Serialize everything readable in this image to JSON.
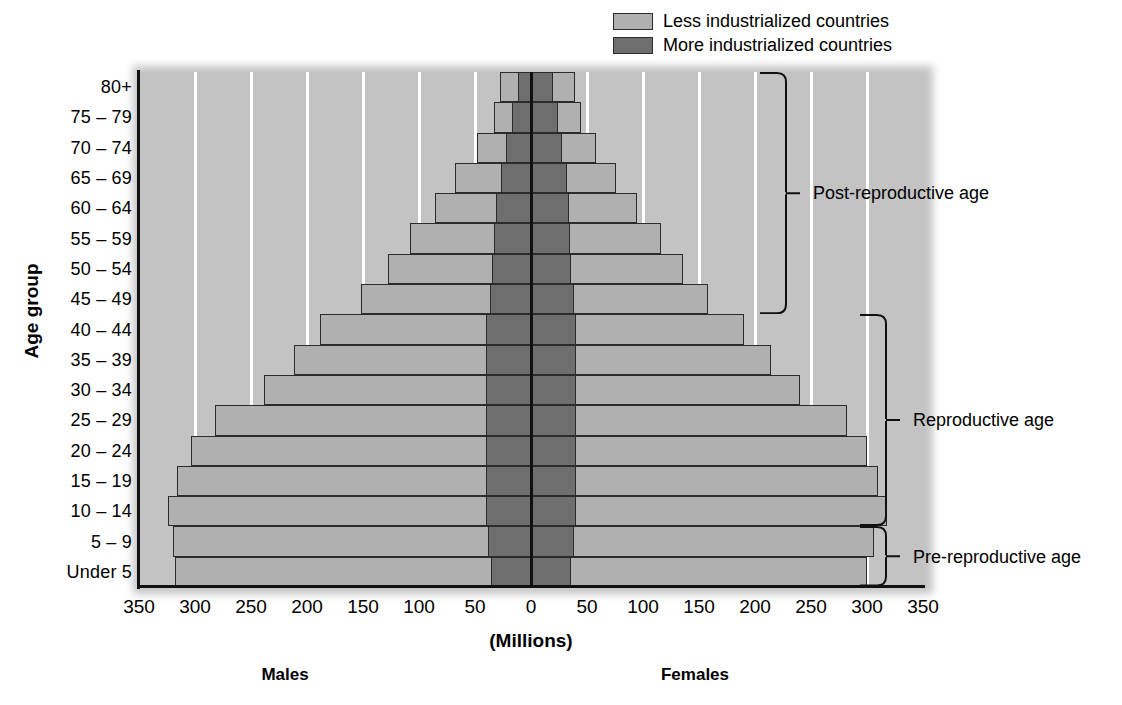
{
  "chart_data": {
    "type": "bar",
    "subtype": "population-pyramid",
    "title": "",
    "xlabel": "(Millions)",
    "ylabel": "Age group",
    "grid": true,
    "legend_position": "top-right",
    "xlim": [
      -350,
      350
    ],
    "x_tick_labels": [
      "350",
      "300",
      "250",
      "200",
      "150",
      "100",
      "50",
      "0",
      "50",
      "100",
      "150",
      "200",
      "250",
      "300",
      "350"
    ],
    "x_tick_values": [
      -350,
      -300,
      -250,
      -200,
      -150,
      -100,
      -50,
      0,
      50,
      100,
      150,
      200,
      250,
      300,
      350
    ],
    "side_labels": {
      "left": "Males",
      "right": "Females"
    },
    "categories": [
      "80+",
      "75 – 79",
      "70 – 74",
      "65 – 69",
      "60 – 64",
      "55 – 59",
      "50 – 54",
      "45 – 49",
      "40 – 44",
      "35 – 39",
      "30 – 34",
      "25 – 29",
      "20 – 24",
      "15 – 19",
      "10 – 14",
      "5 – 9",
      "Under 5"
    ],
    "series": [
      {
        "name": "More industrialized countries",
        "color": "#6e6e6e",
        "males": [
          12,
          17,
          22,
          27,
          31,
          33,
          35,
          37,
          40,
          40,
          40,
          40,
          40,
          40,
          40,
          38,
          36
        ],
        "females": [
          20,
          24,
          28,
          32,
          34,
          35,
          36,
          38,
          40,
          40,
          40,
          40,
          40,
          40,
          40,
          38,
          36
        ]
      },
      {
        "name": "Less industrialized countries",
        "color": "#b0b0b0",
        "males": [
          28,
          33,
          48,
          68,
          86,
          108,
          128,
          152,
          188,
          212,
          238,
          282,
          304,
          316,
          324,
          320,
          318
        ],
        "females": [
          39,
          45,
          58,
          76,
          95,
          116,
          136,
          158,
          190,
          214,
          240,
          282,
          300,
          310,
          318,
          306,
          300
        ]
      }
    ],
    "annotations": [
      {
        "label": "Post-reproductive age",
        "from_category": "80+",
        "to_category": "45 – 49"
      },
      {
        "label": "Reproductive age",
        "from_category": "40 – 44",
        "to_category": "10 – 14"
      },
      {
        "label": "Pre-reproductive age",
        "from_category": "10 – 14",
        "to_category": "Under 5"
      }
    ]
  },
  "legend": {
    "items": [
      {
        "label": "Less industrialized countries",
        "color": "#b0b0b0"
      },
      {
        "label": "More industrialized countries",
        "color": "#6e6e6e"
      }
    ]
  },
  "axes": {
    "y_title": "Age group",
    "x_title": "(Millions)"
  },
  "footer": {
    "males": "Males",
    "females": "Females"
  }
}
